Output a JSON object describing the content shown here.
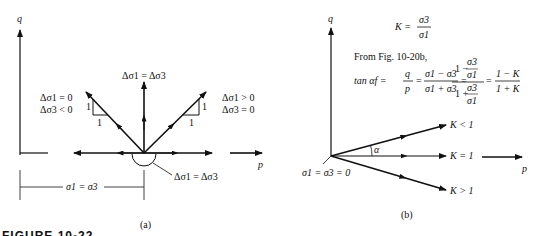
{
  "figure": {
    "caption_label": "FIGURE 10-22",
    "panel_a": {
      "label": "(a)",
      "axis_q": "q",
      "axis_p": "p",
      "top_label": "Δσ1 = Δσ3",
      "left_labels": [
        "Δσ1 = 0",
        "Δσ3 < 0"
      ],
      "right_labels": [
        "Δσ1 > 0",
        "Δσ3 = 0"
      ],
      "slope_left": {
        "rise": "1",
        "run": "1"
      },
      "slope_right": {
        "rise": "1",
        "run": "1"
      },
      "arc_label": "Δσ1 = Δσ3",
      "dimension_label": "σ1 = σ3"
    },
    "panel_b": {
      "label": "(b)",
      "axis_q": "q",
      "axis_p": "p",
      "k_def": {
        "lhs": "K =",
        "num": "σ3",
        "den": "σ1"
      },
      "from_text": "From Fig. 10-20b,",
      "tan_eq": {
        "lhs": "tan αf =",
        "q_over_p": {
          "num": "q",
          "den": "p"
        },
        "frac2": {
          "num": "σ1 − σ3",
          "den": "σ1 + σ3"
        },
        "frac3": {
          "num_top": "1 −",
          "num_frac": {
            "num": "σ3",
            "den": "σ1"
          },
          "den_top": "1 +",
          "den_frac": {
            "num": "σ3",
            "den": "σ1"
          }
        },
        "frac4": {
          "num": "1 − K",
          "den": "1 + K"
        }
      },
      "alpha_label": "α",
      "lines": [
        "K < 1",
        "K = 1",
        "K > 1"
      ],
      "origin_label": "σ1 = σ3 = 0"
    }
  }
}
